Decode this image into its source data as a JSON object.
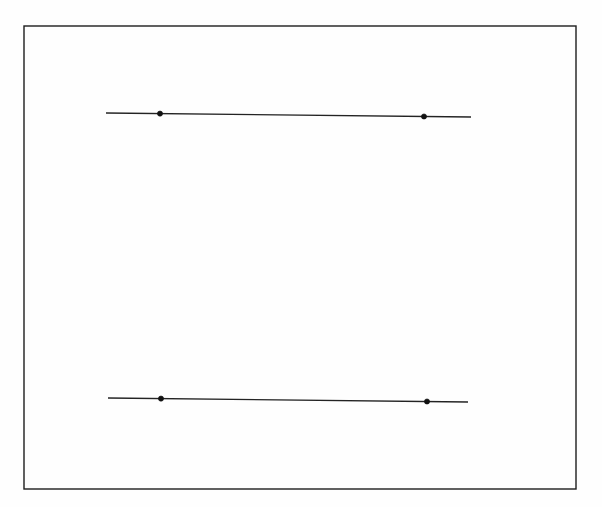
{
  "figure": {
    "title": "",
    "background_color": "#ffffff",
    "frame": {
      "name": "plot-frame",
      "x": 24,
      "y": 26,
      "width": 552,
      "height": 463,
      "stroke_color": "#1d1d1d",
      "stroke_width": 1.4
    },
    "canvas": {
      "width": 602,
      "height": 507
    }
  },
  "chart_data": {
    "type": "line",
    "title": "",
    "subtitle": "",
    "xlabel": "",
    "ylabel": "",
    "xlim": [
      24,
      576
    ],
    "ylim": [
      26,
      489
    ],
    "grid": false,
    "axes_visible": false,
    "frame_visible": true,
    "legend": null,
    "legend_position": "none",
    "tick_labels_x": [],
    "tick_labels_y": [],
    "annotations": [],
    "line_color": "#232323",
    "marker_color": "#111111",
    "marker_radius": 2.6,
    "series": [
      {
        "name": "upper-segment",
        "label": "",
        "x": [
          106,
          471
        ],
        "y": [
          113,
          117
        ],
        "markers": [
          {
            "name": "upper-left-marker",
            "x": 160,
            "y": 113.6
          },
          {
            "name": "upper-right-marker",
            "x": 424,
            "y": 116.5
          }
        ]
      },
      {
        "name": "lower-segment",
        "label": "",
        "x": [
          108,
          468
        ],
        "y": [
          398,
          402
        ],
        "markers": [
          {
            "name": "lower-left-marker",
            "x": 161,
            "y": 398.6
          },
          {
            "name": "lower-right-marker",
            "x": 427,
            "y": 401.5
          }
        ]
      }
    ]
  }
}
